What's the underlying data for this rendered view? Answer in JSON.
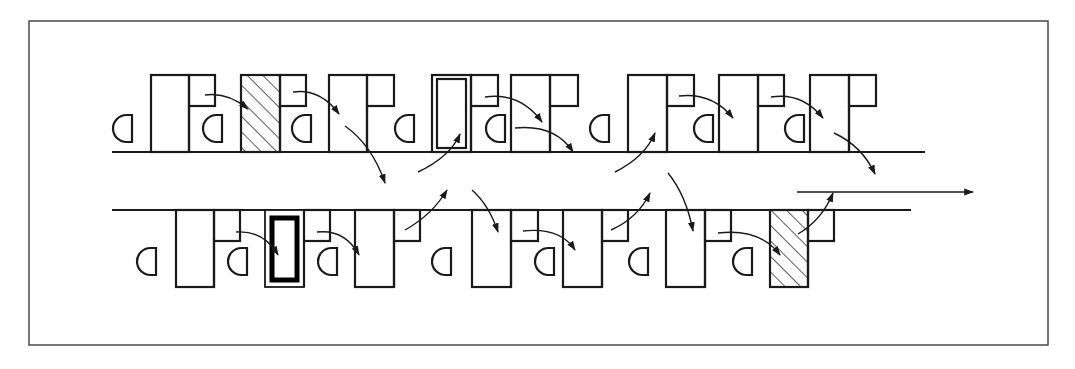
{
  "diagram": {
    "title": "",
    "colors": {
      "stroke": "#1a1a1a",
      "frame": "#4a4a4a",
      "background": "#ffffff",
      "fill": "#ffffff"
    },
    "frame": {
      "x": 29,
      "y": 21,
      "w": 1019,
      "h": 324
    },
    "lines": [
      {
        "id": "top-track",
        "x1": 112,
        "y1": 152,
        "x2": 925,
        "y2": 152
      },
      {
        "id": "bottom-track",
        "x1": 112,
        "y1": 210,
        "x2": 911,
        "y2": 210
      }
    ],
    "top_row": {
      "baseline": 152,
      "top": 75,
      "small_h": 31,
      "units": [
        {
          "big": [
            151,
            189
          ],
          "big_style": "plain",
          "small": [
            189,
            215
          ],
          "d": 113
        },
        {
          "big": null,
          "small": null,
          "d": 203
        },
        {
          "big": [
            241,
            280
          ],
          "big_style": "hatched",
          "small": [
            280,
            306
          ],
          "d": 292
        },
        {
          "big": [
            329,
            367
          ],
          "big_style": "plain",
          "small": [
            367,
            394
          ],
          "d": 395
        },
        {
          "big": [
            432,
            471
          ],
          "big_style": "double",
          "small": [
            471,
            498
          ],
          "d": 486
        },
        {
          "big": [
            511,
            550
          ],
          "big_style": "plain",
          "small": [
            550,
            578
          ],
          "d": 590
        },
        {
          "big": [
            628,
            667
          ],
          "big_style": "plain",
          "small": [
            667,
            694
          ],
          "d": 694
        },
        {
          "big": [
            719,
            758
          ],
          "big_style": "plain",
          "small": [
            758,
            784
          ],
          "d": 785
        },
        {
          "big": [
            810,
            849
          ],
          "big_style": "plain",
          "small": [
            849,
            876
          ],
          "d": null
        }
      ]
    },
    "bottom_row": {
      "baseline": 210,
      "bottom": 287,
      "small_h": 31,
      "units": [
        {
          "big": [
            176,
            214
          ],
          "big_style": "plain",
          "small": [
            214,
            240
          ],
          "d": 137
        },
        {
          "big": null,
          "small": null,
          "d": 228
        },
        {
          "big": [
            265,
            304
          ],
          "big_style": "thick",
          "small": [
            304,
            330
          ],
          "d": 318
        },
        {
          "big": [
            355,
            394
          ],
          "big_style": "plain",
          "small": [
            394,
            420
          ],
          "d": 432
        },
        {
          "big": [
            472,
            511
          ],
          "big_style": "plain",
          "small": [
            511,
            538
          ],
          "d": 535
        },
        {
          "big": [
            563,
            602
          ],
          "big_style": "plain",
          "small": [
            602,
            628
          ],
          "d": 629
        },
        {
          "big": [
            666,
            705
          ],
          "big_style": "plain",
          "small": [
            705,
            731
          ],
          "d": 733
        },
        {
          "big": [
            770,
            808
          ],
          "big_style": "hatched",
          "small": [
            808,
            834
          ],
          "d": null
        }
      ]
    },
    "arrows": [
      {
        "from": [
          205,
          95
        ],
        "ctrl": [
          228,
          92
        ],
        "to": [
          248,
          109
        ]
      },
      {
        "from": [
          293,
          92
        ],
        "ctrl": [
          320,
          88
        ],
        "to": [
          339,
          114
        ]
      },
      {
        "from": [
          345,
          126
        ],
        "ctrl": [
          372,
          145
        ],
        "to": [
          385,
          183
        ]
      },
      {
        "from": [
          418,
          172
        ],
        "ctrl": [
          450,
          157
        ],
        "to": [
          460,
          134
        ]
      },
      {
        "from": [
          485,
          97
        ],
        "ctrl": [
          520,
          92
        ],
        "to": [
          542,
          122
        ]
      },
      {
        "from": [
          515,
          128
        ],
        "ctrl": [
          555,
          124
        ],
        "to": [
          573,
          152
        ]
      },
      {
        "from": [
          615,
          172
        ],
        "ctrl": [
          645,
          157
        ],
        "to": [
          655,
          133
        ]
      },
      {
        "from": [
          679,
          96
        ],
        "ctrl": [
          712,
          92
        ],
        "to": [
          733,
          118
        ]
      },
      {
        "from": [
          771,
          97
        ],
        "ctrl": [
          802,
          92
        ],
        "to": [
          823,
          118
        ]
      },
      {
        "from": [
          834,
          133
        ],
        "ctrl": [
          862,
          146
        ],
        "to": [
          875,
          174
        ]
      },
      {
        "from": [
          405,
          230
        ],
        "ctrl": [
          432,
          215
        ],
        "to": [
          447,
          190
        ]
      },
      {
        "from": [
          472,
          190
        ],
        "ctrl": [
          489,
          205
        ],
        "to": [
          498,
          232
        ]
      },
      {
        "from": [
          236,
          232
        ],
        "ctrl": [
          264,
          230
        ],
        "to": [
          278,
          255
        ]
      },
      {
        "from": [
          317,
          232
        ],
        "ctrl": [
          345,
          229
        ],
        "to": [
          359,
          255
        ]
      },
      {
        "from": [
          523,
          231
        ],
        "ctrl": [
          560,
          227
        ],
        "to": [
          575,
          250
        ]
      },
      {
        "from": [
          611,
          230
        ],
        "ctrl": [
          638,
          218
        ],
        "to": [
          650,
          193
        ]
      },
      {
        "from": [
          668,
          173
        ],
        "ctrl": [
          686,
          195
        ],
        "to": [
          693,
          231
        ]
      },
      {
        "from": [
          718,
          233
        ],
        "ctrl": [
          760,
          228
        ],
        "to": [
          780,
          255
        ]
      },
      {
        "from": [
          798,
          234
        ],
        "ctrl": [
          822,
          220
        ],
        "to": [
          833,
          193
        ]
      },
      {
        "from": [
          797,
          192
        ],
        "ctrl": null,
        "to": [
          973,
          192
        ]
      }
    ]
  }
}
